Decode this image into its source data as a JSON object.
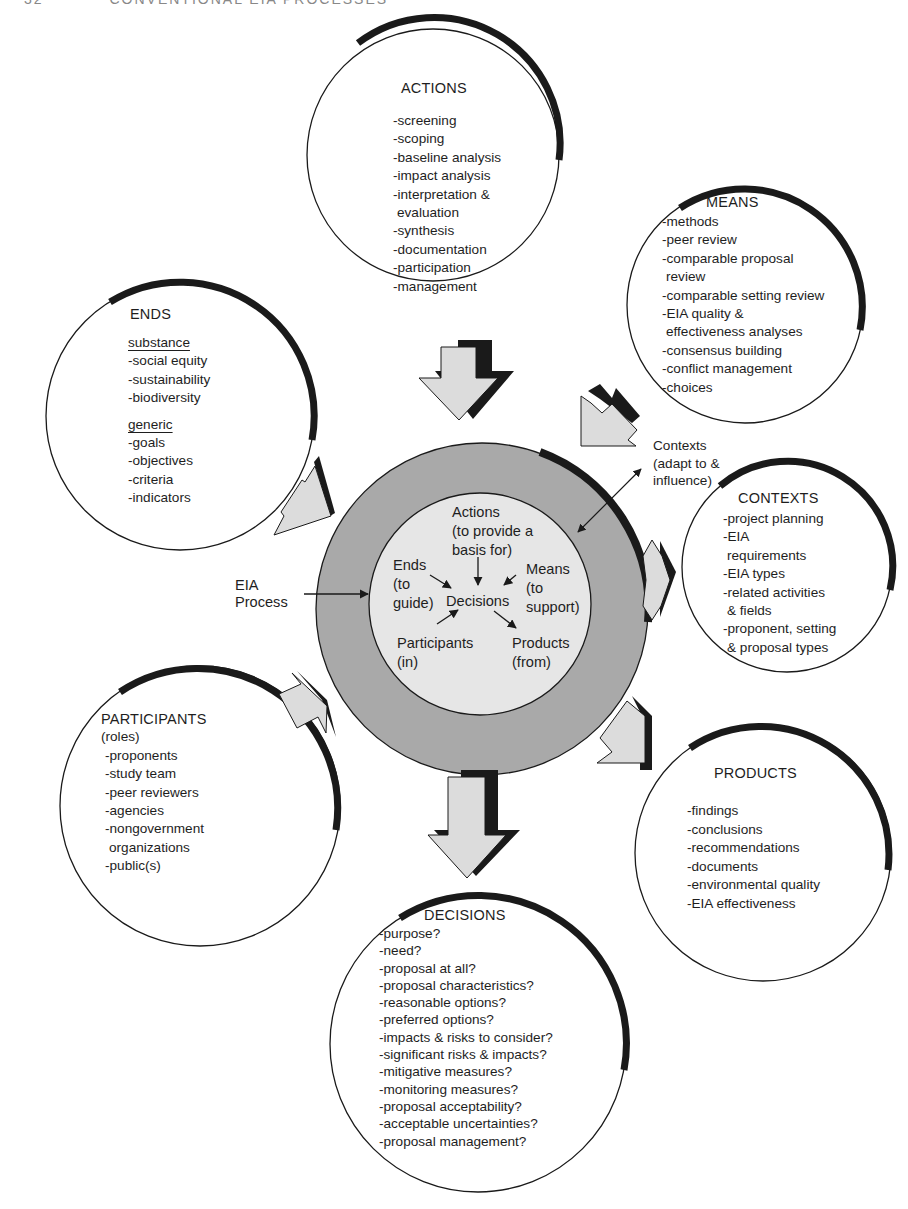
{
  "page_header": {
    "page_number": "32",
    "running_title": "CONVENTIONAL EIA PROCESSES"
  },
  "colors": {
    "ring": "#a9a9a9",
    "inner_disc": "#e6e6e6",
    "arrow_fill": "#dcdcdc",
    "ink": "#1a1a1a"
  },
  "center": {
    "outer_label": [
      "EIA",
      "Process"
    ],
    "actions": [
      "Actions",
      "(to provide a",
      "basis for)"
    ],
    "ends": [
      "Ends",
      "(to",
      "guide)"
    ],
    "means": [
      "Means",
      "(to",
      "support)"
    ],
    "decisions": "Decisions",
    "participants": [
      "Participants",
      "(in)"
    ],
    "products": [
      "Products",
      "(from)"
    ],
    "contexts_callout": [
      "Contexts",
      "(adapt to &",
      "influence)"
    ]
  },
  "circles": {
    "actions": {
      "title": "ACTIONS",
      "items": [
        "-screening",
        "-scoping",
        "-baseline analysis",
        "-impact analysis",
        "-interpretation &",
        " evaluation",
        "-synthesis",
        "-documentation",
        "-participation",
        "-management"
      ]
    },
    "means": {
      "title": "MEANS",
      "items": [
        "-methods",
        "-peer review",
        "-comparable proposal",
        " review",
        "-comparable setting review",
        "-EIA quality &",
        " effectiveness analyses",
        "-consensus building",
        "-conflict management",
        "-choices"
      ]
    },
    "ends": {
      "title": "ENDS",
      "subhead_1": "substance",
      "items_1": [
        "-social equity",
        "-sustainability",
        "-biodiversity"
      ],
      "subhead_2": "generic",
      "items_2": [
        "-goals",
        "-objectives",
        "-criteria",
        "-indicators"
      ]
    },
    "contexts": {
      "title": "CONTEXTS",
      "items": [
        "-project planning",
        "-EIA",
        " requirements",
        "-EIA types",
        "-related activities",
        " & fields",
        "-proponent, setting",
        " & proposal types"
      ]
    },
    "participants": {
      "title": "PARTICIPANTS",
      "subtitle": "(roles)",
      "items": [
        "-proponents",
        "-study team",
        "-peer reviewers",
        "-agencies",
        "-nongovernment",
        " organizations",
        "-public(s)"
      ]
    },
    "products": {
      "title": "PRODUCTS",
      "items": [
        "-findings",
        "-conclusions",
        "-recommendations",
        "-documents",
        "-environmental quality",
        "-EIA effectiveness"
      ]
    },
    "decisions": {
      "title": "DECISIONS",
      "items": [
        "-purpose?",
        "-need?",
        "-proposal at all?",
        "-proposal characteristics?",
        "-reasonable options?",
        "-preferred options?",
        "-impacts & risks to consider?",
        "-significant risks & impacts?",
        "-mitigative measures?",
        "-monitoring measures?",
        "-proposal acceptability?",
        "-acceptable uncertainties?",
        "-proposal management?"
      ]
    }
  }
}
